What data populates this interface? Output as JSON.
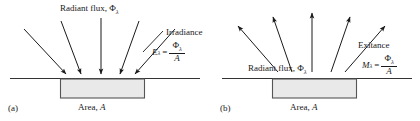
{
  "figure": {
    "panels": [
      {
        "tag": "(a)",
        "concept": "Irradiance",
        "flux_label": "Radiant flux, Φ",
        "flux_sub": "λ",
        "callout": "Irradiance",
        "equation": {
          "lhs": "E",
          "lhs_sub": "λ",
          "equals": "=",
          "numerator": "Φ",
          "numerator_sub": "λ",
          "denominator": "A"
        },
        "area_label": "Area, ",
        "area_symbol": "A",
        "arrow_direction": "incoming",
        "arrow_count": 5
      },
      {
        "tag": "(b)",
        "concept": "Exitance",
        "flux_label": "Radiant flux, Φ",
        "flux_sub": "λ",
        "callout": "Exitance",
        "equation": {
          "lhs": "M",
          "lhs_sub": "λ",
          "equals": "=",
          "numerator": "Φ",
          "numerator_sub": "λ",
          "denominator": "A"
        },
        "area_label": "Area, ",
        "area_symbol": "A",
        "arrow_direction": "outgoing",
        "arrow_count": 5
      }
    ],
    "colors": {
      "ink": "#1a1a1a",
      "surface_fill": "#e9e9e9",
      "surface_stroke": "#555555",
      "ground_line": "#333333",
      "background": "#ffffff"
    }
  }
}
